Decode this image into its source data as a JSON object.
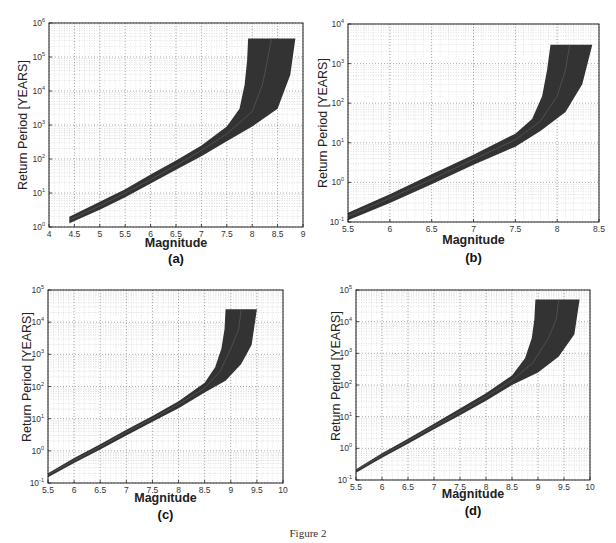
{
  "figure": {
    "caption": "Figure 2"
  },
  "chart_data": [
    {
      "id": "a",
      "type": "area",
      "panel_label": "(a)",
      "title": "",
      "xlabel": "Magnitude",
      "ylabel": "Return Period [YEARS]",
      "xscale": "linear",
      "yscale": "log",
      "xlim": [
        4,
        9
      ],
      "ylim": [
        1,
        1000000
      ],
      "xticks": [
        "4",
        "4.5",
        "5",
        "5.5",
        "6",
        "6.5",
        "7",
        "7.5",
        "8",
        "8.5",
        "9"
      ],
      "yticks": [
        "10^0",
        "10^1",
        "10^2",
        "10^3",
        "10^4",
        "10^5",
        "10^6"
      ],
      "grid": true,
      "legend": null,
      "series": [
        {
          "name": "upper bound",
          "x": [
            4.4,
            5.0,
            5.5,
            6.0,
            6.5,
            7.0,
            7.5,
            7.75,
            7.85,
            7.9,
            7.92
          ],
          "y": [
            2,
            5.5,
            13,
            35,
            90,
            250,
            900,
            3000,
            15000,
            80000,
            350000
          ]
        },
        {
          "name": "median",
          "x": [
            4.4,
            5.0,
            5.5,
            6.0,
            6.5,
            7.0,
            7.5,
            8.0,
            8.2,
            8.3,
            8.38
          ],
          "y": [
            1.6,
            4.2,
            10,
            25,
            65,
            180,
            550,
            2500,
            15000,
            80000,
            350000
          ]
        },
        {
          "name": "lower bound",
          "x": [
            4.4,
            5.0,
            5.5,
            6.0,
            6.5,
            7.0,
            7.5,
            8.0,
            8.5,
            8.75,
            8.85
          ],
          "y": [
            1.3,
            3.2,
            7.5,
            19,
            48,
            120,
            330,
            900,
            3000,
            30000,
            350000
          ]
        }
      ],
      "plateau": {
        "y": 350000,
        "x_from": 7.92,
        "x_to": 8.85
      }
    },
    {
      "id": "b",
      "type": "area",
      "panel_label": "(b)",
      "title": "",
      "xlabel": "Magnitude",
      "ylabel": "Return Period [YEARS]",
      "xscale": "linear",
      "yscale": "log",
      "xlim": [
        5.5,
        8.5
      ],
      "ylim": [
        0.1,
        10000
      ],
      "xticks": [
        "5.5",
        "6",
        "6.5",
        "7",
        "7.5",
        "8",
        "8.5"
      ],
      "yticks": [
        "10^-1",
        "10^0",
        "10^1",
        "10^2",
        "10^3",
        "10^4"
      ],
      "grid": true,
      "legend": null,
      "series": [
        {
          "name": "upper bound",
          "x": [
            5.5,
            6.0,
            6.5,
            7.0,
            7.5,
            7.7,
            7.82,
            7.88,
            7.92
          ],
          "y": [
            0.17,
            0.5,
            1.6,
            5,
            17,
            40,
            150,
            700,
            3000
          ]
        },
        {
          "name": "median",
          "x": [
            5.5,
            6.0,
            6.5,
            7.0,
            7.5,
            7.8,
            8.0,
            8.1,
            8.15
          ],
          "y": [
            0.14,
            0.4,
            1.2,
            3.8,
            12,
            35,
            150,
            700,
            3000
          ]
        },
        {
          "name": "lower bound",
          "x": [
            5.5,
            6.0,
            6.5,
            7.0,
            7.5,
            7.8,
            8.1,
            8.3,
            8.42
          ],
          "y": [
            0.11,
            0.3,
            0.9,
            2.8,
            8,
            20,
            60,
            300,
            3000
          ]
        }
      ],
      "plateau": {
        "y": 3000,
        "x_from": 7.92,
        "x_to": 8.42
      }
    },
    {
      "id": "c",
      "type": "area",
      "panel_label": "(c)",
      "title": "",
      "xlabel": "Magnitude",
      "ylabel": "Return Period [YEARS]",
      "xscale": "linear",
      "yscale": "log",
      "xlim": [
        5.5,
        10
      ],
      "ylim": [
        0.1,
        100000
      ],
      "xticks": [
        "5.5",
        "6",
        "6.5",
        "7",
        "7.5",
        "8",
        "8.5",
        "9",
        "9.5",
        "10"
      ],
      "yticks": [
        "10^-1",
        "10^0",
        "10^1",
        "10^2",
        "10^3",
        "10^4",
        "10^5"
      ],
      "grid": true,
      "legend": null,
      "series": [
        {
          "name": "upper bound",
          "x": [
            5.5,
            6.0,
            6.5,
            7.0,
            7.5,
            8.0,
            8.5,
            8.7,
            8.82,
            8.88,
            8.9
          ],
          "y": [
            0.2,
            0.6,
            1.6,
            4.5,
            12,
            35,
            130,
            400,
            1500,
            6000,
            25000
          ]
        },
        {
          "name": "median",
          "x": [
            5.5,
            6.0,
            6.5,
            7.0,
            7.5,
            8.0,
            8.5,
            8.8,
            9.0,
            9.15,
            9.2
          ],
          "y": [
            0.18,
            0.5,
            1.35,
            3.8,
            10,
            28,
            90,
            300,
            1500,
            6000,
            25000
          ]
        },
        {
          "name": "lower bound",
          "x": [
            5.5,
            6.0,
            6.5,
            7.0,
            7.5,
            8.0,
            8.5,
            8.9,
            9.2,
            9.4,
            9.5
          ],
          "y": [
            0.15,
            0.42,
            1.1,
            3,
            8,
            21,
            65,
            150,
            500,
            2000,
            25000
          ]
        }
      ],
      "plateau": {
        "y": 25000,
        "x_from": 8.9,
        "x_to": 9.5
      }
    },
    {
      "id": "d",
      "type": "area",
      "panel_label": "(d)",
      "title": "",
      "xlabel": "Magnitude",
      "ylabel": "Return Period [YEARS]",
      "xscale": "linear",
      "yscale": "log",
      "xlim": [
        5.5,
        10
      ],
      "ylim": [
        0.1,
        100000
      ],
      "xticks": [
        "5.5",
        "6",
        "6.5",
        "7",
        "7.5",
        "8",
        "8.5",
        "9",
        "9.5",
        "10"
      ],
      "yticks": [
        "10^-1",
        "10^0",
        "10^1",
        "10^2",
        "10^3",
        "10^4",
        "10^5"
      ],
      "grid": true,
      "legend": null,
      "series": [
        {
          "name": "upper bound",
          "x": [
            5.5,
            6.0,
            6.5,
            7.0,
            7.5,
            8.0,
            8.5,
            8.75,
            8.88,
            8.93,
            8.95
          ],
          "y": [
            0.22,
            0.7,
            2,
            6,
            18,
            55,
            200,
            700,
            3000,
            12000,
            50000
          ]
        },
        {
          "name": "median",
          "x": [
            5.5,
            6.0,
            6.5,
            7.0,
            7.5,
            8.0,
            8.5,
            8.9,
            9.2,
            9.35,
            9.4
          ],
          "y": [
            0.2,
            0.6,
            1.7,
            5,
            14,
            42,
            140,
            500,
            3000,
            12000,
            50000
          ]
        },
        {
          "name": "lower bound",
          "x": [
            5.5,
            6.0,
            6.5,
            7.0,
            7.5,
            8.0,
            8.5,
            9.0,
            9.4,
            9.7,
            9.8
          ],
          "y": [
            0.17,
            0.5,
            1.4,
            4,
            11,
            32,
            100,
            250,
            800,
            4000,
            50000
          ]
        }
      ],
      "plateau": {
        "y": 50000,
        "x_from": 8.95,
        "x_to": 9.8
      }
    }
  ],
  "style": {
    "band_color": "#333333",
    "median_color": "#555555",
    "grid_color": "#9a9a9a",
    "axis_color": "#222222"
  }
}
